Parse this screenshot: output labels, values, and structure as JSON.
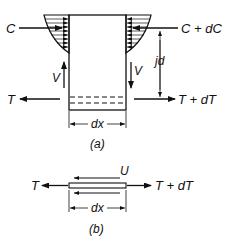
{
  "figure_a": {
    "labels": {
      "c_left": "C",
      "c_right": "C + dC",
      "t_left": "T",
      "t_right": "T + dT",
      "v_left": "V",
      "v_right": "V",
      "lever_arm": "jd",
      "width": "dx",
      "caption": "(a)"
    }
  },
  "figure_b": {
    "labels": {
      "t_left": "T",
      "t_right": "T + dT",
      "bond": "U",
      "width": "dx",
      "caption": "(b)"
    }
  },
  "colors": {
    "line": "#111111",
    "background": "#ffffff"
  }
}
